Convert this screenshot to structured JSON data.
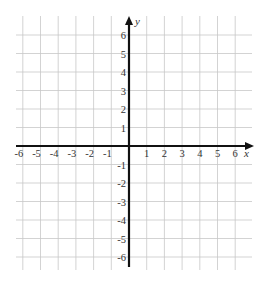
{
  "chart_data": {
    "type": "coordinate-plane",
    "title": "",
    "xlabel": "x",
    "ylabel": "y",
    "xlim": [
      -6,
      6
    ],
    "ylim": [
      -6,
      6
    ],
    "grid": true,
    "x_ticks": [
      "-6",
      "-5",
      "-4",
      "-3",
      "-2",
      "-1",
      "1",
      "2",
      "3",
      "4",
      "5",
      "6"
    ],
    "y_ticks": [
      "6",
      "5",
      "4",
      "3",
      "2",
      "1",
      "-1",
      "-2",
      "-3",
      "-4",
      "-5",
      "-6"
    ],
    "series": []
  },
  "colors": {
    "grid": "#c8c8c8",
    "axis": "#111111",
    "text": "#333333",
    "background": "#ffffff"
  }
}
